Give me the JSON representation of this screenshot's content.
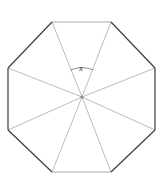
{
  "figure": {
    "kind": "regular-octagon-with-central-spokes",
    "background_color": "#ffffff",
    "outline_color": "#3d3d3d",
    "spoke_color": "#a9a9a9",
    "arc_color": "#6b6b6b",
    "center_dot_color": "#8c8c8c",
    "outline_width": 1.2,
    "spoke_width": 0.8,
    "center": {
      "x": 82,
      "y": 97
    },
    "vertices": [
      {
        "name": "top-left",
        "x": 52,
        "y": 22
      },
      {
        "name": "top-right",
        "x": 111,
        "y": 22
      },
      {
        "name": "right-top",
        "x": 155,
        "y": 68
      },
      {
        "name": "right-bottom",
        "x": 155,
        "y": 130
      },
      {
        "name": "bottom-right",
        "x": 111,
        "y": 172
      },
      {
        "name": "bottom-left",
        "x": 52,
        "y": 172
      },
      {
        "name": "left-bottom",
        "x": 8,
        "y": 130
      },
      {
        "name": "left-top",
        "x": 8,
        "y": 68
      }
    ],
    "sides": 8,
    "spokes": 8,
    "angle_marker": {
      "label": "x",
      "label_x": 81,
      "label_y": 71,
      "arc_radius": 30,
      "arc_start_x": 70.5,
      "arc_start_y": 70.0,
      "arc_end_x": 93.5,
      "arc_end_y": 70.0
    }
  }
}
